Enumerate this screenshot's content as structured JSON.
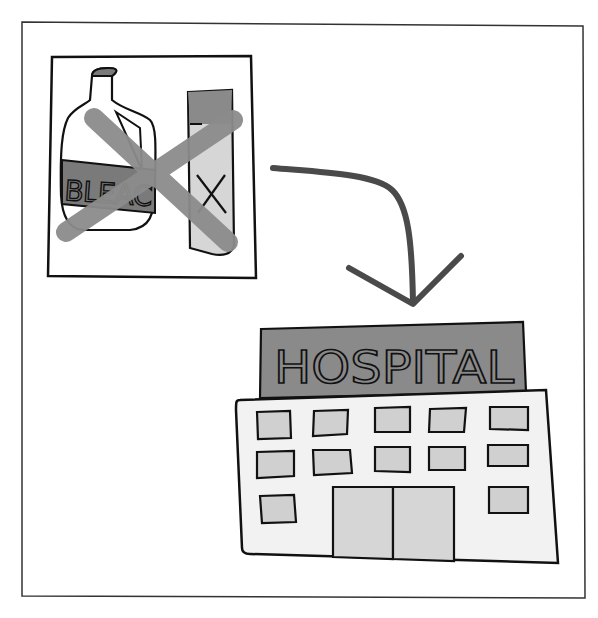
{
  "illustration": {
    "description": "Do not mix bleach with other cleaning products; doing so can lead to the hospital",
    "left_panel": {
      "bottle_label": "BLEACH",
      "bottle_label_visible": "BLEAC",
      "box_mark": "X",
      "crossed_out": true
    },
    "arrow": {
      "direction": "down-right"
    },
    "hospital": {
      "sign_text": "HOSPITAL",
      "window_count": 13,
      "door_count": 2
    },
    "colors": {
      "background": "#ffffff",
      "outline": "#111111",
      "frame": "#333333",
      "arrow": "#4a4a4a",
      "cross": "#8c8c8c",
      "label_dark": "#7a7a7a",
      "sign": "#8a8a8a",
      "building": "#f2f2f2",
      "window": "#d0d0d0",
      "box_light": "#d6d6d6",
      "box_top": "#8a8a8a"
    }
  }
}
